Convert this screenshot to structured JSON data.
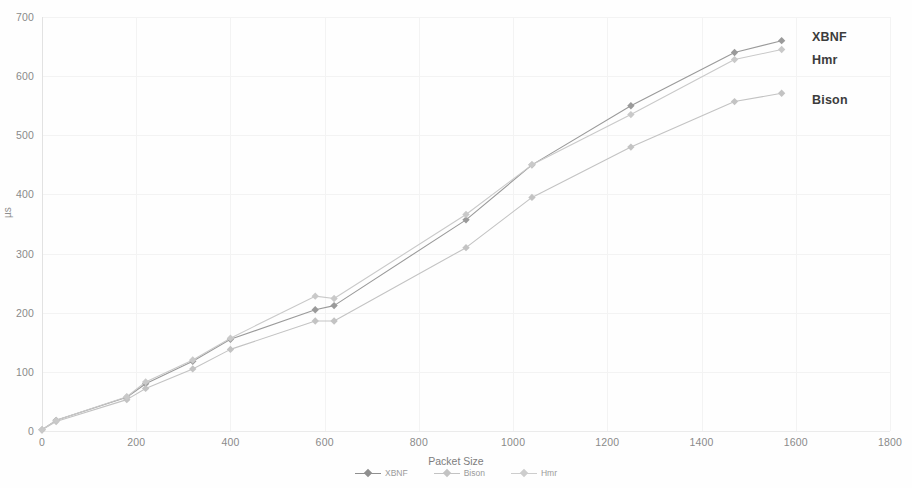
{
  "chart_data": {
    "type": "line",
    "title": "",
    "xlabel": "Packet Size",
    "ylabel": "µs",
    "xlim": [
      0,
      1800
    ],
    "ylim": [
      0,
      700
    ],
    "xticks": [
      0,
      200,
      400,
      600,
      800,
      1000,
      1200,
      1400,
      1600,
      1800
    ],
    "yticks": [
      0,
      100,
      200,
      300,
      400,
      500,
      600,
      700
    ],
    "grid": true,
    "legend_position": "bottom",
    "series": [
      {
        "name": "XBNF",
        "color": "#9a9a9a",
        "marker": "diamond",
        "x": [
          0,
          30,
          180,
          220,
          320,
          400,
          580,
          620,
          900,
          1040,
          1250,
          1470,
          1570
        ],
        "y": [
          2,
          18,
          57,
          80,
          118,
          155,
          205,
          212,
          357,
          450,
          550,
          640,
          660
        ]
      },
      {
        "name": "Bison",
        "color": "#c3c3c3",
        "marker": "diamond",
        "x": [
          0,
          30,
          180,
          220,
          320,
          400,
          580,
          620,
          900,
          1040,
          1250,
          1470,
          1570
        ],
        "y": [
          2,
          16,
          53,
          72,
          105,
          138,
          186,
          186,
          310,
          395,
          480,
          557,
          571
        ]
      },
      {
        "name": "Hmr",
        "color": "#c9c9c9",
        "marker": "diamond",
        "x": [
          0,
          30,
          180,
          220,
          320,
          400,
          580,
          620,
          900,
          1040,
          1250,
          1470,
          1570
        ],
        "y": [
          2,
          18,
          58,
          83,
          120,
          157,
          228,
          224,
          366,
          450,
          535,
          628,
          645
        ]
      }
    ],
    "inline_annotations": [
      {
        "label": "XBNF",
        "x_px": 812,
        "y_px": 30
      },
      {
        "label": "Hmr",
        "x_px": 812,
        "y_px": 53
      },
      {
        "label": "Bison",
        "x_px": 812,
        "y_px": 93
      }
    ],
    "legend_entries": [
      {
        "label": "XBNF",
        "color": "#8f8f8f"
      },
      {
        "label": "Bison",
        "color": "#c3c3c3"
      },
      {
        "label": "Hmr",
        "color": "#cdcdcd"
      }
    ]
  },
  "colors": {
    "background": "#fefefe",
    "grid": "#f3f3f3",
    "axis": "#e4e4e4",
    "tick_text": "#8a8a8a",
    "label_text": "#3c3c3c"
  }
}
